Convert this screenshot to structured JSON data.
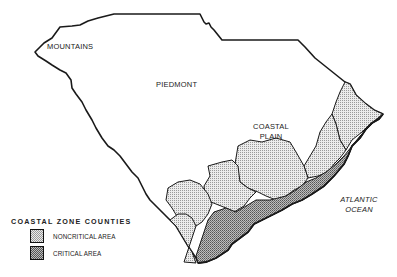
{
  "map": {
    "title": "",
    "regions": [
      {
        "name": "mountains",
        "label": "MOUNTAINS"
      },
      {
        "name": "piedmont",
        "label": "PIEDMONT"
      },
      {
        "name": "coastal-plain",
        "label_line1": "COASTAL",
        "label_line2": "PLAIN"
      }
    ],
    "water": {
      "label_line1": "ATLANTIC",
      "label_line2": "OCEAN"
    }
  },
  "legend": {
    "title": "COASTAL ZONE COUNTIES",
    "items": [
      {
        "label": "NONCRITICAL AREA",
        "pattern": "light-dots"
      },
      {
        "label": "CRITICAL AREA",
        "pattern": "dense-grid"
      }
    ]
  },
  "colors": {
    "outline": "#1a1a1a",
    "noncritical_fill": "#dcdcdc",
    "critical_fill": "#9a9a9a",
    "background": "#ffffff"
  }
}
